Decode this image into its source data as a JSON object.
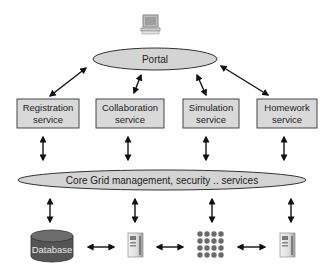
{
  "diagram": {
    "client": {
      "icon": "desktop-computer-icon"
    },
    "portal": {
      "label": "Portal"
    },
    "services": [
      {
        "line1": "Registration",
        "line2": "service"
      },
      {
        "line1": "Collaboration",
        "line2": "service"
      },
      {
        "line1": "Simulation",
        "line2": "service"
      },
      {
        "line1": "Homework",
        "line2": "service"
      }
    ],
    "core": {
      "label": "Core Grid management, security .. services"
    },
    "resources": [
      {
        "type": "database",
        "label": "Database",
        "icon": "database-icon"
      },
      {
        "type": "server",
        "icon": "server-tower-icon"
      },
      {
        "type": "cluster",
        "icon": "compute-cluster-icon"
      },
      {
        "type": "server",
        "icon": "server-tower-icon"
      }
    ],
    "colors": {
      "box_fill": "#d9d9d9",
      "ellipse_fill": "#d4d4d4",
      "stroke": "#333333",
      "database_fill": "#555555",
      "cluster_node": "#6a6a6a"
    }
  }
}
